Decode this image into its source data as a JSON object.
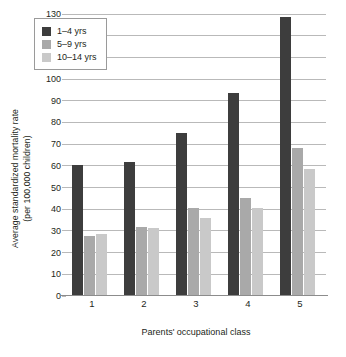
{
  "chart_data": {
    "type": "bar",
    "title": "",
    "subtitle": "",
    "xlabel": "Parents' occupational class",
    "ylabel": "Average standardized mortality rate\n(per 100,000 children)",
    "ylabel_line1": "Average standardized mortality rate",
    "ylabel_line2": "(per 100,000 children)",
    "categories": [
      "1",
      "2",
      "3",
      "4",
      "5"
    ],
    "series": [
      {
        "name": "1–4 yrs",
        "color": "#3d3d3d",
        "values": [
          60,
          61.5,
          74.5,
          93,
          128
        ]
      },
      {
        "name": "5–9 yrs",
        "color": "#a9a9a9",
        "values": [
          27,
          31.5,
          40,
          44.5,
          68
        ]
      },
      {
        "name": "10–14 yrs",
        "color": "#c9c9c9",
        "values": [
          28,
          31,
          35.5,
          40,
          58
        ]
      }
    ],
    "ylim": [
      0,
      130
    ],
    "ytick_step": 10,
    "yticks": [
      0,
      10,
      20,
      30,
      40,
      50,
      60,
      70,
      80,
      90,
      100,
      110,
      120,
      130
    ],
    "grid": true,
    "grid_axis": "y",
    "legend_position": "top-left-inside",
    "background": "#ffffff",
    "gridline_color": "#b9b9b9",
    "axis_color": "#8c8c8c",
    "text_color": "#231f20"
  }
}
